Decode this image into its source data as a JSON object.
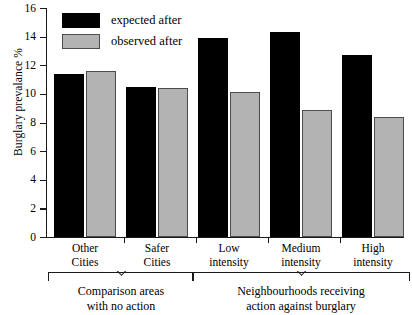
{
  "chart_data": {
    "type": "bar",
    "title": "",
    "xlabel": "",
    "ylabel": "Burglary prevalance %",
    "ylim": [
      0,
      16
    ],
    "yticks": [
      0,
      2,
      4,
      6,
      8,
      10,
      12,
      14,
      16
    ],
    "grid": false,
    "legend_position": "top-left",
    "categories": [
      "Other Cities",
      "Safer Cities",
      "Low intensity",
      "Medium intensity",
      "High intensity"
    ],
    "category_lines": [
      [
        "Other",
        "Cities"
      ],
      [
        "Safer",
        "Cities"
      ],
      [
        "Low",
        "intensity"
      ],
      [
        "Medium",
        "intensity"
      ],
      [
        "High",
        "intensity"
      ]
    ],
    "series": [
      {
        "name": "expected after",
        "color": "#000000",
        "values": [
          11.4,
          10.5,
          13.9,
          14.3,
          12.7
        ]
      },
      {
        "name": "observed after",
        "color": "#b3b3b3",
        "values": [
          11.6,
          10.4,
          10.1,
          8.9,
          8.4
        ]
      }
    ],
    "annotations": [
      {
        "name": "comparison-bracket",
        "lines": [
          "Comparison areas",
          "with no action"
        ],
        "covers": [
          "Other Cities",
          "Safer Cities"
        ]
      },
      {
        "name": "action-bracket",
        "lines": [
          "Neighbourhoods receiving",
          "action against burglary"
        ],
        "covers": [
          "Low intensity",
          "Medium intensity",
          "High intensity"
        ]
      }
    ]
  },
  "axis": {
    "y_title": "Burglary prevalance %",
    "y_tick_labels": [
      "16",
      "14",
      "12",
      "10",
      "8",
      "6",
      "4",
      "2",
      "0"
    ]
  },
  "legend": {
    "items": [
      {
        "label": "expected after",
        "swatch": "expected"
      },
      {
        "label": "observed after",
        "swatch": "observed"
      }
    ]
  },
  "brackets": {
    "left": {
      "line1": "Comparison areas",
      "line2": "with no action"
    },
    "right": {
      "line1": "Neighbourhoods receiving",
      "line2": "action against burglary"
    }
  },
  "xlabels": [
    {
      "line1": "Other",
      "line2": "Cities"
    },
    {
      "line1": "Safer",
      "line2": "Cities"
    },
    {
      "line1": "Low",
      "line2": "intensity"
    },
    {
      "line1": "Medium",
      "line2": "intensity"
    },
    {
      "line1": "High",
      "line2": "intensity"
    }
  ]
}
